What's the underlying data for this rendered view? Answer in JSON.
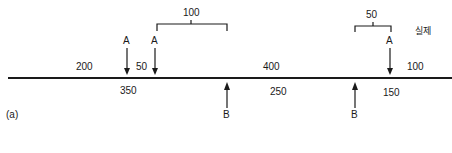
{
  "diagram": {
    "panel_label": "(a)",
    "legend_label": "실제",
    "top_segments": [
      {
        "value": "200"
      },
      {
        "value": "50"
      },
      {
        "value": "400"
      },
      {
        "value": "100"
      }
    ],
    "bottom_segments": [
      {
        "value": "350"
      },
      {
        "value": "250"
      },
      {
        "value": "150"
      }
    ],
    "brackets": [
      {
        "value": "100"
      },
      {
        "value": "50"
      }
    ],
    "markers_A": [
      {
        "label": "A"
      },
      {
        "label": "A"
      },
      {
        "label": "A"
      }
    ],
    "markers_B": [
      {
        "label": "B"
      },
      {
        "label": "B"
      }
    ]
  }
}
